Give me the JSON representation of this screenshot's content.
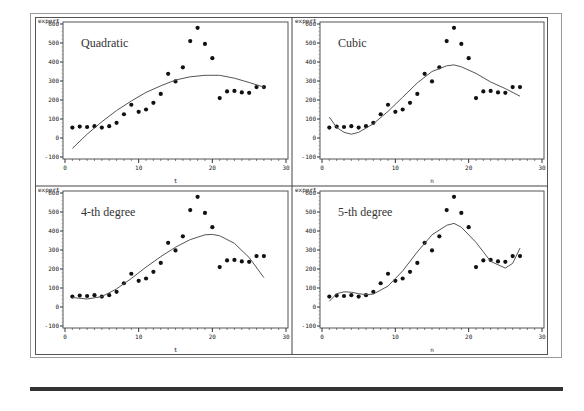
{
  "chart_data": [
    {
      "type": "scatter",
      "title": "Quadratic",
      "xlabel": "t",
      "ylabel": "export",
      "xlim": [
        0,
        30
      ],
      "ylim": [
        -100,
        600
      ],
      "xticks": [
        0,
        10,
        20,
        30
      ],
      "yticks": [
        -100,
        0,
        100,
        200,
        300,
        400,
        500,
        600
      ],
      "grid": false,
      "series": [
        {
          "name": "export (observed)",
          "kind": "points",
          "x": [
            1,
            2,
            3,
            4,
            5,
            6,
            7,
            8,
            9,
            10,
            11,
            12,
            13,
            14,
            15,
            16,
            17,
            18,
            19,
            20,
            21,
            22,
            23,
            24,
            25,
            26,
            27
          ],
          "values": [
            55,
            60,
            58,
            62,
            55,
            62,
            80,
            125,
            175,
            138,
            150,
            185,
            232,
            338,
            298,
            372,
            510,
            580,
            495,
            420,
            210,
            245,
            248,
            240,
            238,
            268,
            268
          ]
        },
        {
          "name": "fitted (quadratic)",
          "kind": "line",
          "x": [
            1,
            3,
            5,
            7,
            9,
            11,
            13,
            15,
            17,
            19,
            21,
            23,
            25,
            27
          ],
          "values": [
            -55,
            20,
            85,
            145,
            195,
            240,
            275,
            305,
            322,
            330,
            330,
            315,
            292,
            268
          ]
        }
      ]
    },
    {
      "type": "scatter",
      "title": "Cubic",
      "xlabel": "n",
      "ylabel": "export",
      "xlim": [
        0,
        30
      ],
      "ylim": [
        -100,
        600
      ],
      "xticks": [
        0,
        10,
        20,
        30
      ],
      "yticks": [
        -100,
        0,
        100,
        200,
        300,
        400,
        500,
        600
      ],
      "grid": false,
      "series": [
        {
          "name": "export (observed)",
          "kind": "points",
          "x": [
            1,
            2,
            3,
            4,
            5,
            6,
            7,
            8,
            9,
            10,
            11,
            12,
            13,
            14,
            15,
            16,
            17,
            18,
            19,
            20,
            21,
            22,
            23,
            24,
            25,
            26,
            27
          ],
          "values": [
            55,
            60,
            58,
            62,
            55,
            62,
            80,
            125,
            175,
            138,
            150,
            185,
            232,
            338,
            298,
            372,
            510,
            580,
            495,
            420,
            210,
            245,
            248,
            240,
            238,
            268,
            268
          ]
        },
        {
          "name": "fitted (cubic)",
          "kind": "line",
          "x": [
            1,
            2,
            3,
            4,
            5,
            7,
            9,
            11,
            13,
            15,
            17,
            18,
            19,
            21,
            23,
            25,
            27
          ],
          "values": [
            110,
            55,
            30,
            20,
            30,
            75,
            140,
            215,
            290,
            350,
            380,
            385,
            375,
            340,
            295,
            260,
            220
          ]
        }
      ]
    },
    {
      "type": "scatter",
      "title": "4-th degree",
      "xlabel": "t",
      "ylabel": "export",
      "xlim": [
        0,
        30
      ],
      "ylim": [
        -100,
        600
      ],
      "xticks": [
        0,
        10,
        20,
        30
      ],
      "yticks": [
        -100,
        0,
        100,
        200,
        300,
        400,
        500,
        600
      ],
      "grid": false,
      "series": [
        {
          "name": "export (observed)",
          "kind": "points",
          "x": [
            1,
            2,
            3,
            4,
            5,
            6,
            7,
            8,
            9,
            10,
            11,
            12,
            13,
            14,
            15,
            16,
            17,
            18,
            19,
            20,
            21,
            22,
            23,
            24,
            25,
            26,
            27
          ],
          "values": [
            55,
            60,
            58,
            62,
            55,
            62,
            80,
            125,
            175,
            138,
            150,
            185,
            232,
            338,
            298,
            372,
            510,
            580,
            495,
            420,
            210,
            245,
            248,
            240,
            238,
            268,
            268
          ]
        },
        {
          "name": "fitted (4th degree)",
          "kind": "line",
          "x": [
            1,
            3,
            5,
            7,
            9,
            11,
            13,
            15,
            17,
            19,
            20,
            21,
            23,
            25,
            27
          ],
          "values": [
            50,
            42,
            55,
            95,
            150,
            210,
            265,
            315,
            355,
            380,
            382,
            375,
            335,
            260,
            155
          ]
        }
      ]
    },
    {
      "type": "scatter",
      "title": "5-th degree",
      "xlabel": "n",
      "ylabel": "export",
      "xlim": [
        0,
        30
      ],
      "ylim": [
        -100,
        600
      ],
      "xticks": [
        0,
        10,
        20,
        30
      ],
      "yticks": [
        -100,
        0,
        100,
        200,
        300,
        400,
        500,
        600
      ],
      "grid": false,
      "series": [
        {
          "name": "export (observed)",
          "kind": "points",
          "x": [
            1,
            2,
            3,
            4,
            5,
            6,
            7,
            8,
            9,
            10,
            11,
            12,
            13,
            14,
            15,
            16,
            17,
            18,
            19,
            20,
            21,
            22,
            23,
            24,
            25,
            26,
            27
          ],
          "values": [
            55,
            60,
            58,
            62,
            55,
            62,
            80,
            125,
            175,
            138,
            150,
            185,
            232,
            338,
            298,
            372,
            510,
            580,
            495,
            420,
            210,
            245,
            248,
            240,
            238,
            268,
            268
          ]
        },
        {
          "name": "fitted (5th degree)",
          "kind": "line",
          "x": [
            1,
            2,
            3,
            4,
            5,
            6,
            7,
            9,
            11,
            13,
            15,
            17,
            18,
            19,
            21,
            23,
            25,
            26,
            27
          ],
          "values": [
            30,
            70,
            80,
            78,
            70,
            65,
            68,
            110,
            190,
            290,
            380,
            430,
            440,
            420,
            340,
            240,
            205,
            230,
            310
          ]
        }
      ]
    }
  ],
  "panels": [
    {
      "title": "Quadratic",
      "ylabel": "export",
      "xlabel": "t"
    },
    {
      "title": "Cubic",
      "ylabel": "export",
      "xlabel": "n"
    },
    {
      "title": "4-th degree",
      "ylabel": "export",
      "xlabel": "t"
    },
    {
      "title": "5-th degree",
      "ylabel": "export",
      "xlabel": "n"
    }
  ]
}
